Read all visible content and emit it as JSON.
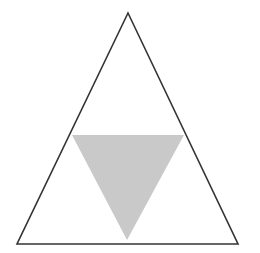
{
  "diagram": {
    "width": 260,
    "height": 253,
    "background": "#ffffff",
    "outer_triangle": {
      "points": "128,13 17,244 238,244",
      "fill": "none",
      "stroke": "#333333",
      "stroke_width": 1.6
    },
    "inner_triangle": {
      "points": "72,135 184,135 127,240",
      "fill": "#c9c9c9",
      "stroke": "none"
    }
  }
}
